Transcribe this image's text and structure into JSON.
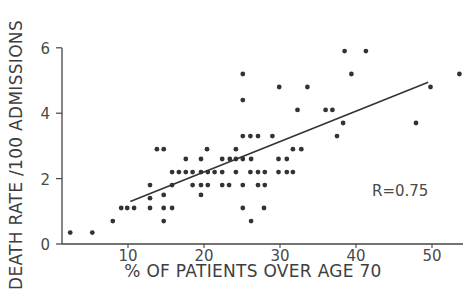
{
  "chart_data": {
    "type": "scatter",
    "title": "",
    "xlabel": "% OF PATIENTS OVER AGE 70",
    "ylabel": "DEATH RATE /100 ADMISSIONS",
    "xlim": [
      1.3,
      54
    ],
    "ylim": [
      0,
      6
    ],
    "x_ticks": [
      10,
      20,
      30,
      40,
      50
    ],
    "y_ticks": [
      0,
      2,
      4,
      6
    ],
    "grid": false,
    "legend": null,
    "annotations": [
      {
        "text": "R=0.75",
        "x": 42.5,
        "y": 1.6
      }
    ],
    "regression_line": {
      "x": [
        10.3,
        49.5
      ],
      "y": [
        1.3,
        4.95
      ]
    },
    "points": [
      [
        2.4,
        0.35
      ],
      [
        5.3,
        0.35
      ],
      [
        8.0,
        0.7
      ],
      [
        9.1,
        1.1
      ],
      [
        9.9,
        1.1
      ],
      [
        10.8,
        1.1
      ],
      [
        12.9,
        1.1
      ],
      [
        12.9,
        1.4
      ],
      [
        12.9,
        1.8
      ],
      [
        13.8,
        2.9
      ],
      [
        14.7,
        2.9
      ],
      [
        14.7,
        0.7
      ],
      [
        14.7,
        1.1
      ],
      [
        14.7,
        1.5
      ],
      [
        15.8,
        1.1
      ],
      [
        15.8,
        1.8
      ],
      [
        15.8,
        2.2
      ],
      [
        16.7,
        2.2
      ],
      [
        17.6,
        2.2
      ],
      [
        18.5,
        2.2
      ],
      [
        19.6,
        2.2
      ],
      [
        20.5,
        2.2
      ],
      [
        21.4,
        2.2
      ],
      [
        22.4,
        2.2
      ],
      [
        17.6,
        2.6
      ],
      [
        19.6,
        2.6
      ],
      [
        18.5,
        1.8
      ],
      [
        19.6,
        1.8
      ],
      [
        20.5,
        1.8
      ],
      [
        22.4,
        1.8
      ],
      [
        23.3,
        1.8
      ],
      [
        25.1,
        1.8
      ],
      [
        27.1,
        1.8
      ],
      [
        28.0,
        1.8
      ],
      [
        19.6,
        1.5
      ],
      [
        20.4,
        2.9
      ],
      [
        22.4,
        2.6
      ],
      [
        23.4,
        2.6
      ],
      [
        24.2,
        2.6
      ],
      [
        25.1,
        2.6
      ],
      [
        26.2,
        2.6
      ],
      [
        24.2,
        2.9
      ],
      [
        25.1,
        1.1
      ],
      [
        26.2,
        0.7
      ],
      [
        27.9,
        1.1
      ],
      [
        24.2,
        2.2
      ],
      [
        26.1,
        2.2
      ],
      [
        27.1,
        2.2
      ],
      [
        28.0,
        2.2
      ],
      [
        29.8,
        2.2
      ],
      [
        25.1,
        3.3
      ],
      [
        26.1,
        3.3
      ],
      [
        27.1,
        3.3
      ],
      [
        29.0,
        3.3
      ],
      [
        25.1,
        5.2
      ],
      [
        25.1,
        4.4
      ],
      [
        29.9,
        4.8
      ],
      [
        30.9,
        2.2
      ],
      [
        31.7,
        2.2
      ],
      [
        30.9,
        2.6
      ],
      [
        31.7,
        2.9
      ],
      [
        32.8,
        2.9
      ],
      [
        32.3,
        4.1
      ],
      [
        36.0,
        4.1
      ],
      [
        36.9,
        4.1
      ],
      [
        29.8,
        2.6
      ],
      [
        37.5,
        3.3
      ],
      [
        38.3,
        3.7
      ],
      [
        33.6,
        4.8
      ],
      [
        38.5,
        5.9
      ],
      [
        41.3,
        5.9
      ],
      [
        39.4,
        5.2
      ],
      [
        47.9,
        3.7
      ],
      [
        49.8,
        4.8
      ],
      [
        53.6,
        5.2
      ]
    ]
  },
  "colors": {
    "background": "#ffffff",
    "ink": "#333333",
    "axis": "#444444"
  }
}
